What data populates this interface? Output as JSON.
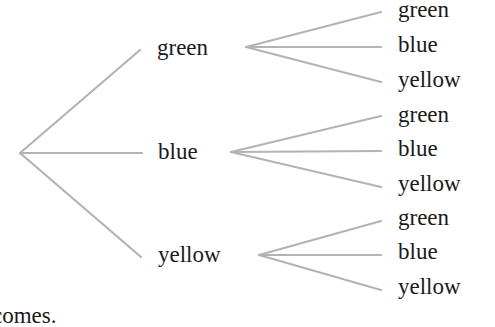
{
  "diagram": {
    "type": "tree",
    "line_color": "#b0b0b0",
    "level1": [
      {
        "label": "green",
        "children": [
          "green",
          "blue",
          "yellow"
        ]
      },
      {
        "label": "blue",
        "children": [
          "green",
          "blue",
          "yellow"
        ]
      },
      {
        "label": "yellow",
        "children": [
          "green",
          "blue",
          "yellow"
        ]
      }
    ],
    "caption_fragment": "comes."
  }
}
